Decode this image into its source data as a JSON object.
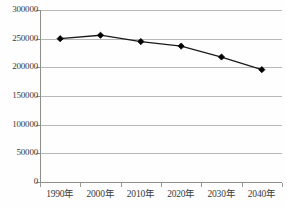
{
  "chart_data": {
    "type": "line",
    "title": "",
    "subtitle": "",
    "xlabel": "",
    "ylabel": "",
    "categories": [
      "1990年",
      "2000年",
      "2010年",
      "2020年",
      "2030年",
      "2040年"
    ],
    "values": [
      250000,
      256000,
      245000,
      237000,
      218000,
      196000
    ],
    "series": [
      {
        "name": "",
        "values": [
          250000,
          256000,
          245000,
          237000,
          218000,
          196000
        ]
      }
    ],
    "ylim": [
      0,
      300000
    ],
    "yticks": [
      0,
      50000,
      100000,
      150000,
      200000,
      250000,
      300000
    ],
    "ytick_labels": [
      "0",
      "50000",
      "100000",
      "150000",
      "200000",
      "250000",
      "300000"
    ],
    "xtick_labels": [
      "1990年",
      "2000年",
      "2010年",
      "2020年",
      "2030年",
      "2040年"
    ],
    "grid": true,
    "grid_axis": "y",
    "legend": false,
    "legend_position": "none",
    "marker": "diamond",
    "line_color": "#1a1a1a",
    "marker_color": "#000000",
    "grid_color": "#b8b8b4",
    "axis_color": "#8f8f8a",
    "background_color": "#fefefe",
    "text_color": "#3a3a3a"
  }
}
